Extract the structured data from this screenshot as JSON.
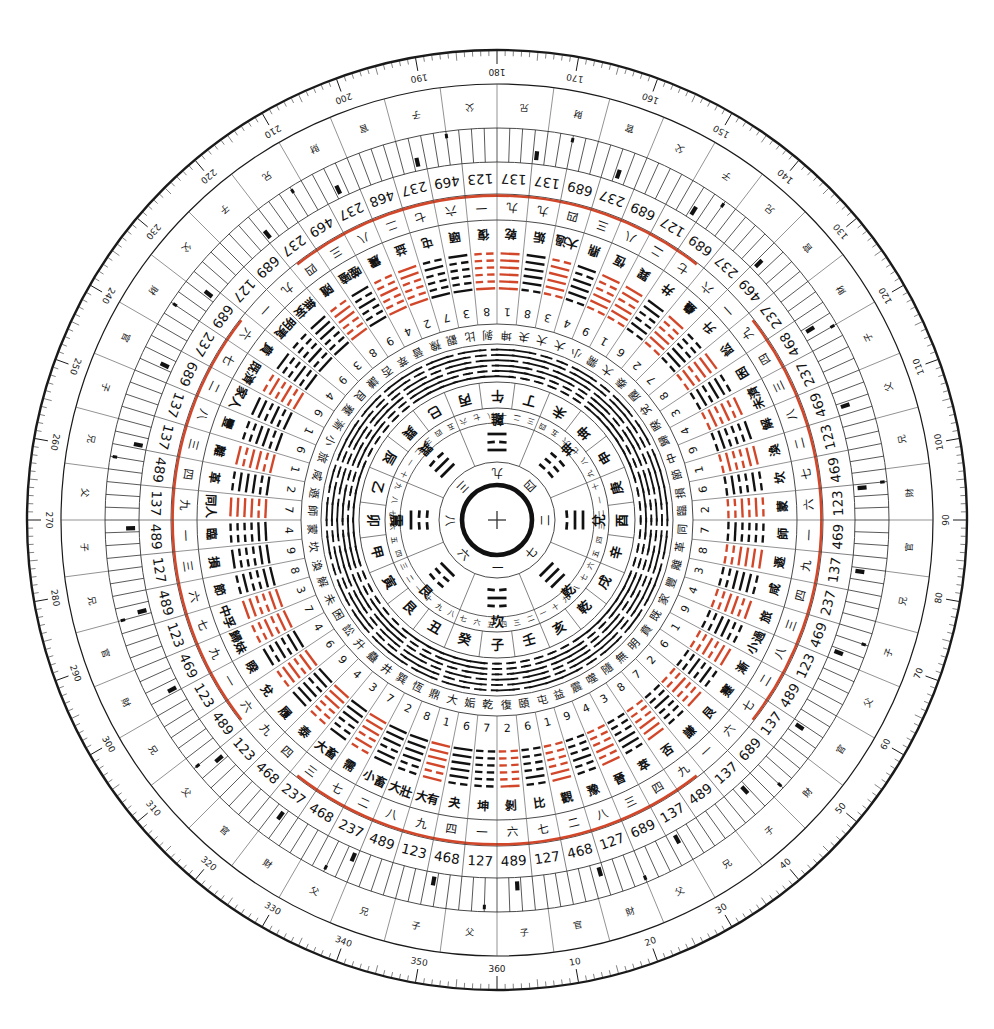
{
  "meta": {
    "width": 994,
    "height": 1029,
    "center_x": 497,
    "center_y": 520,
    "background": "#ffffff",
    "ink": "#111111",
    "accent_red": "#d2472a",
    "rule": "#4a4a4a"
  },
  "center": {
    "crosshair_glyph": "+",
    "name": "heaven-pool-crosshair"
  },
  "degree_ring": {
    "name": "degree-scale",
    "labels": [
      "10",
      "20",
      "30",
      "40",
      "50",
      "60",
      "70",
      "80",
      "90",
      "100",
      "110",
      "120",
      "130",
      "140",
      "150",
      "160",
      "170",
      "180",
      "190",
      "200",
      "210",
      "220",
      "230",
      "240",
      "250",
      "260",
      "270",
      "280",
      "290",
      "300",
      "310",
      "320",
      "330",
      "340",
      "350",
      "360"
    ],
    "step": 10,
    "minor_step": 1,
    "zero_at": "bottom",
    "direction": "counterclockwise"
  },
  "luoshu_inner": {
    "name": "luoshu-numbers",
    "values": [
      "九",
      "四",
      "二",
      "七",
      "一",
      "六",
      "八",
      "三"
    ]
  },
  "trigram_ring": {
    "name": "eight-trigrams",
    "items": [
      {
        "label": "離",
        "lines": [
          1,
          0,
          1
        ],
        "angle": 0
      },
      {
        "label": "坤",
        "lines": [
          0,
          0,
          0
        ],
        "angle": 45
      },
      {
        "label": "兌",
        "lines": [
          0,
          1,
          1
        ],
        "angle": 90
      },
      {
        "label": "乾",
        "lines": [
          1,
          1,
          1
        ],
        "angle": 135
      },
      {
        "label": "坎",
        "lines": [
          0,
          1,
          0
        ],
        "angle": 180
      },
      {
        "label": "艮",
        "lines": [
          1,
          0,
          0
        ],
        "angle": 225
      },
      {
        "label": "震",
        "lines": [
          0,
          0,
          1
        ],
        "angle": 270
      },
      {
        "label": "巽",
        "lines": [
          1,
          1,
          0
        ],
        "angle": 315
      }
    ]
  },
  "mountains_24": {
    "name": "twenty-four-mountains",
    "items": [
      {
        "label": "午",
        "color": "black"
      },
      {
        "label": "丁",
        "color": "black"
      },
      {
        "label": "未",
        "color": "black"
      },
      {
        "label": "坤",
        "color": "black"
      },
      {
        "label": "申",
        "color": "red"
      },
      {
        "label": "庚",
        "color": "red"
      },
      {
        "label": "酉",
        "color": "black"
      },
      {
        "label": "辛",
        "color": "black"
      },
      {
        "label": "戌",
        "color": "black"
      },
      {
        "label": "乾",
        "color": "black"
      },
      {
        "label": "亥",
        "color": "red"
      },
      {
        "label": "壬",
        "color": "red"
      },
      {
        "label": "子",
        "color": "black"
      },
      {
        "label": "癸",
        "color": "black"
      },
      {
        "label": "丑",
        "color": "black"
      },
      {
        "label": "艮",
        "color": "black"
      },
      {
        "label": "寅",
        "color": "red"
      },
      {
        "label": "甲",
        "color": "red"
      },
      {
        "label": "卯",
        "color": "black"
      },
      {
        "label": "乙",
        "color": "black"
      },
      {
        "label": "辰",
        "color": "black"
      },
      {
        "label": "巽",
        "color": "black"
      },
      {
        "label": "巳",
        "color": "red"
      },
      {
        "label": "丙",
        "color": "red"
      }
    ]
  },
  "hexagrams_64": {
    "name": "sixty-four-hexagrams",
    "note": "Fu Xi circular sequence, read clockwise from top",
    "items": [
      {
        "name": "乾",
        "lines": [
          1,
          1,
          1,
          1,
          1,
          1
        ],
        "num": "1",
        "cnum": "九",
        "color": "red"
      },
      {
        "name": "姤",
        "lines": [
          0,
          1,
          1,
          1,
          1,
          1
        ],
        "num": "8",
        "cnum": "九",
        "color": "black"
      },
      {
        "name": "大過",
        "lines": [
          0,
          1,
          1,
          1,
          1,
          0
        ],
        "num": "3",
        "cnum": "四",
        "color": "red"
      },
      {
        "name": "鼎",
        "lines": [
          0,
          1,
          1,
          1,
          0,
          1
        ],
        "num": "4",
        "cnum": "三",
        "color": "black"
      },
      {
        "name": "恆",
        "lines": [
          0,
          1,
          1,
          0,
          0,
          1
        ],
        "num": "9",
        "cnum": "八",
        "color": "red"
      },
      {
        "name": "巽",
        "lines": [
          0,
          1,
          1,
          0,
          1,
          1
        ],
        "num": "1",
        "cnum": "二",
        "color": "red"
      },
      {
        "name": "井",
        "lines": [
          0,
          1,
          0,
          0,
          1,
          1
        ],
        "num": "6",
        "cnum": "七",
        "color": "black"
      },
      {
        "name": "蠱",
        "lines": [
          0,
          1,
          1,
          0,
          0,
          1
        ],
        "num": "2",
        "cnum": "六",
        "color": "red"
      },
      {
        "name": "升",
        "lines": [
          0,
          1,
          1,
          0,
          0,
          0
        ],
        "num": "7",
        "cnum": "一",
        "color": "black"
      },
      {
        "name": "訟",
        "lines": [
          0,
          1,
          0,
          1,
          1,
          1
        ],
        "num": "8",
        "cnum": "九",
        "color": "red"
      },
      {
        "name": "困",
        "lines": [
          0,
          1,
          0,
          1,
          1,
          0
        ],
        "num": "3",
        "cnum": "四",
        "color": "black"
      },
      {
        "name": "未濟",
        "lines": [
          0,
          1,
          0,
          1,
          0,
          1
        ],
        "num": "4",
        "cnum": "三",
        "color": "red"
      },
      {
        "name": "解",
        "lines": [
          0,
          1,
          0,
          0,
          0,
          1
        ],
        "num": "9",
        "cnum": "八",
        "color": "black"
      },
      {
        "name": "渙",
        "lines": [
          0,
          1,
          0,
          0,
          1,
          1
        ],
        "num": "1",
        "cnum": "二",
        "color": "red"
      },
      {
        "name": "坎",
        "lines": [
          0,
          1,
          0,
          0,
          1,
          0
        ],
        "num": "6",
        "cnum": "七",
        "color": "black"
      },
      {
        "name": "蒙",
        "lines": [
          0,
          0,
          1,
          0,
          1,
          0
        ],
        "num": "2",
        "cnum": "六",
        "color": "red"
      },
      {
        "name": "師",
        "lines": [
          0,
          1,
          0,
          0,
          0,
          0
        ],
        "num": "7",
        "cnum": "一",
        "color": "black"
      },
      {
        "name": "遯",
        "lines": [
          0,
          0,
          1,
          1,
          1,
          1
        ],
        "num": "8",
        "cnum": "九",
        "color": "red"
      },
      {
        "name": "咸",
        "lines": [
          0,
          0,
          1,
          1,
          1,
          0
        ],
        "num": "3",
        "cnum": "四",
        "color": "black"
      },
      {
        "name": "旅",
        "lines": [
          0,
          0,
          1,
          1,
          0,
          1
        ],
        "num": "4",
        "cnum": "三",
        "color": "red"
      },
      {
        "name": "小過",
        "lines": [
          0,
          0,
          1,
          1,
          0,
          0
        ],
        "num": "9",
        "cnum": "八",
        "color": "black"
      },
      {
        "name": "漸",
        "lines": [
          0,
          0,
          1,
          0,
          1,
          1
        ],
        "num": "1",
        "cnum": "二",
        "color": "red"
      },
      {
        "name": "蹇",
        "lines": [
          0,
          0,
          1,
          0,
          1,
          0
        ],
        "num": "6",
        "cnum": "七",
        "color": "black"
      },
      {
        "name": "艮",
        "lines": [
          0,
          0,
          1,
          0,
          0,
          1
        ],
        "num": "2",
        "cnum": "六",
        "color": "red"
      },
      {
        "name": "謙",
        "lines": [
          0,
          0,
          1,
          0,
          0,
          0
        ],
        "num": "7",
        "cnum": "一",
        "color": "black"
      },
      {
        "name": "否",
        "lines": [
          0,
          0,
          0,
          1,
          1,
          1
        ],
        "num": "8",
        "cnum": "九",
        "color": "red"
      },
      {
        "name": "萃",
        "lines": [
          0,
          0,
          0,
          1,
          1,
          0
        ],
        "num": "3",
        "cnum": "四",
        "color": "black"
      },
      {
        "name": "晉",
        "lines": [
          0,
          0,
          0,
          1,
          0,
          1
        ],
        "num": "4",
        "cnum": "三",
        "color": "red"
      },
      {
        "name": "豫",
        "lines": [
          0,
          0,
          0,
          1,
          0,
          0
        ],
        "num": "9",
        "cnum": "八",
        "color": "black"
      },
      {
        "name": "觀",
        "lines": [
          0,
          0,
          0,
          0,
          1,
          1
        ],
        "num": "1",
        "cnum": "二",
        "color": "red"
      },
      {
        "name": "比",
        "lines": [
          0,
          0,
          0,
          0,
          1,
          0
        ],
        "num": "6",
        "cnum": "七",
        "color": "black"
      },
      {
        "name": "剝",
        "lines": [
          0,
          0,
          0,
          0,
          0,
          1
        ],
        "num": "2",
        "cnum": "六",
        "color": "red"
      },
      {
        "name": "坤",
        "lines": [
          0,
          0,
          0,
          0,
          0,
          0
        ],
        "num": "7",
        "cnum": "一",
        "color": "black"
      },
      {
        "name": "夬",
        "lines": [
          1,
          1,
          1,
          1,
          1,
          0
        ],
        "num": "6",
        "cnum": "四",
        "color": "black"
      },
      {
        "name": "大有",
        "lines": [
          1,
          1,
          1,
          1,
          0,
          1
        ],
        "num": "1",
        "cnum": "九",
        "color": "red"
      },
      {
        "name": "大壯",
        "lines": [
          1,
          1,
          1,
          1,
          0,
          0
        ],
        "num": "8",
        "cnum": "八",
        "color": "black"
      },
      {
        "name": "小畜",
        "lines": [
          1,
          1,
          1,
          0,
          1,
          1
        ],
        "num": "2",
        "cnum": "二",
        "color": "black"
      },
      {
        "name": "需",
        "lines": [
          1,
          1,
          1,
          0,
          1,
          0
        ],
        "num": "7",
        "cnum": "七",
        "color": "red"
      },
      {
        "name": "大畜",
        "lines": [
          1,
          1,
          1,
          0,
          0,
          1
        ],
        "num": "3",
        "cnum": "三",
        "color": "black"
      },
      {
        "name": "泰",
        "lines": [
          1,
          1,
          1,
          0,
          0,
          0
        ],
        "num": "4",
        "cnum": "四",
        "color": "red"
      },
      {
        "name": "履",
        "lines": [
          1,
          1,
          0,
          1,
          1,
          1
        ],
        "num": "9",
        "cnum": "九",
        "color": "black"
      },
      {
        "name": "兌",
        "lines": [
          1,
          1,
          0,
          1,
          1,
          0
        ],
        "num": "6",
        "cnum": "六",
        "color": "red"
      },
      {
        "name": "睽",
        "lines": [
          1,
          1,
          0,
          1,
          0,
          1
        ],
        "num": "4",
        "cnum": "一",
        "color": "black"
      },
      {
        "name": "歸妹",
        "lines": [
          1,
          1,
          0,
          1,
          0,
          0
        ],
        "num": "7",
        "cnum": "九",
        "color": "red"
      },
      {
        "name": "中孚",
        "lines": [
          1,
          1,
          0,
          0,
          1,
          1
        ],
        "num": "3",
        "cnum": "七",
        "color": "red"
      },
      {
        "name": "節",
        "lines": [
          1,
          1,
          0,
          0,
          1,
          0
        ],
        "num": "8",
        "cnum": "六",
        "color": "black"
      },
      {
        "name": "損",
        "lines": [
          1,
          1,
          0,
          0,
          0,
          1
        ],
        "num": "9",
        "cnum": "三",
        "color": "black"
      },
      {
        "name": "臨",
        "lines": [
          1,
          1,
          0,
          0,
          0,
          0
        ],
        "num": "4",
        "cnum": "一",
        "color": "black"
      },
      {
        "name": "同人",
        "lines": [
          1,
          0,
          1,
          1,
          1,
          1
        ],
        "num": "7",
        "cnum": "九",
        "color": "red"
      },
      {
        "name": "革",
        "lines": [
          1,
          0,
          1,
          1,
          1,
          0
        ],
        "num": "2",
        "cnum": "四",
        "color": "black"
      },
      {
        "name": "離",
        "lines": [
          1,
          0,
          1,
          1,
          0,
          1
        ],
        "num": "1",
        "cnum": "三",
        "color": "red"
      },
      {
        "name": "豐",
        "lines": [
          1,
          0,
          1,
          1,
          0,
          0
        ],
        "num": "6",
        "cnum": "八",
        "color": "black"
      },
      {
        "name": "家人",
        "lines": [
          1,
          0,
          1,
          0,
          1,
          1
        ],
        "num": "1",
        "cnum": "二",
        "color": "black"
      },
      {
        "name": "既濟",
        "lines": [
          1,
          0,
          1,
          0,
          1,
          0
        ],
        "num": "6",
        "cnum": "七",
        "color": "red"
      },
      {
        "name": "賁",
        "lines": [
          1,
          0,
          1,
          0,
          0,
          1
        ],
        "num": "4",
        "cnum": "六",
        "color": "black"
      },
      {
        "name": "明夷",
        "lines": [
          1,
          0,
          1,
          0,
          0,
          0
        ],
        "num": "9",
        "cnum": "一",
        "color": "black"
      },
      {
        "name": "無妄",
        "lines": [
          1,
          0,
          0,
          1,
          1,
          1
        ],
        "num": "3",
        "cnum": "九",
        "color": "black"
      },
      {
        "name": "隨",
        "lines": [
          1,
          0,
          0,
          1,
          1,
          0
        ],
        "num": "8",
        "cnum": "四",
        "color": "red"
      },
      {
        "name": "噬嗑",
        "lines": [
          1,
          0,
          0,
          1,
          0,
          1
        ],
        "num": "9",
        "cnum": "三",
        "color": "black"
      },
      {
        "name": "震",
        "lines": [
          1,
          0,
          0,
          1,
          0,
          0
        ],
        "num": "4",
        "cnum": "八",
        "color": "red"
      },
      {
        "name": "益",
        "lines": [
          1,
          0,
          0,
          0,
          1,
          1
        ],
        "num": "2",
        "cnum": "二",
        "color": "red"
      },
      {
        "name": "屯",
        "lines": [
          1,
          0,
          0,
          0,
          1,
          0
        ],
        "num": "7",
        "cnum": "七",
        "color": "black"
      },
      {
        "name": "頤",
        "lines": [
          1,
          0,
          0,
          0,
          0,
          1
        ],
        "num": "3",
        "cnum": "六",
        "color": "black"
      },
      {
        "name": "復",
        "lines": [
          1,
          0,
          0,
          0,
          0,
          0
        ],
        "num": "8",
        "cnum": "一",
        "color": "red"
      }
    ]
  },
  "number_ring": {
    "name": "three-digit-ring",
    "note": "outer ring of 3-digit star combinations",
    "values": [
      "137",
      "137",
      "689",
      "237",
      "689",
      "127",
      "689",
      "237",
      "469",
      "237",
      "468",
      "237",
      "469",
      "123",
      "469",
      "123",
      "469",
      "137",
      "237",
      "469",
      "123",
      "489",
      "137",
      "689",
      "137",
      "489",
      "137",
      "689",
      "127",
      "468",
      "127",
      "489",
      "127",
      "468",
      "123",
      "489",
      "237",
      "468",
      "237",
      "468",
      "123",
      "489",
      "123",
      "469",
      "123",
      "489",
      "127",
      "489",
      "137",
      "489",
      "137",
      "137",
      "689",
      "237",
      "689",
      "127",
      "689",
      "237",
      "469",
      "237",
      "468",
      "237",
      "469",
      "123"
    ]
  },
  "kinship_ring": {
    "name": "six-relatives-ring",
    "glyphs": [
      "父",
      "子",
      "兄",
      "財",
      "官"
    ],
    "sequence": [
      "父",
      "子",
      "兄",
      "父",
      "財",
      "官",
      "父",
      "兄",
      "財",
      "官",
      "兄",
      "子",
      "父",
      "兄",
      "子",
      "官",
      "財",
      "父",
      "子",
      "兄",
      "財",
      "官",
      "子",
      "父",
      "兄",
      "財",
      "官",
      "父",
      "子",
      "兄",
      "官",
      "財",
      "子",
      "父",
      "兄",
      "財",
      "官",
      "兄",
      "子",
      "父",
      "官",
      "財",
      "子",
      "兄",
      "父",
      "財",
      "官",
      "子"
    ]
  },
  "yao_ring": {
    "name": "moving-line-tick-ring",
    "note": "384 fine radial tick marks with scattered solid blocks marking changing lines"
  },
  "legend_numbers": {
    "name": "chinese-numerals",
    "values": [
      "一",
      "二",
      "三",
      "四",
      "五",
      "六",
      "七",
      "八",
      "九",
      "十"
    ]
  }
}
